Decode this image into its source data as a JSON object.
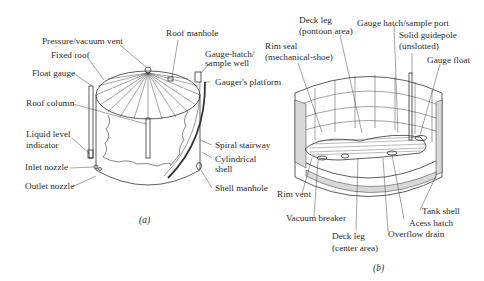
{
  "figure_a": {
    "caption": "(a)",
    "labels": {
      "pressure_vacuum_vent": "Pressure/vacuum vent",
      "roof_manhole": "Roof manhole",
      "fixed_roof": "Fixed roof",
      "gauge_hatch_1": "Gauge-hatch/",
      "gauge_hatch_2": "sample well",
      "float_gauge": "Float gauge",
      "gaugers_platform": "Gauger's platform",
      "roof_column": "Roof column",
      "liquid_level_1": "Liquid level",
      "liquid_level_2": "indicator",
      "spiral_stairway": "Spiral stairway",
      "inlet_nozzle": "Inlet nozzle",
      "cylindrical_shell_1": "Cylindrical",
      "cylindrical_shell_2": "shell",
      "outlet_nozzle": "Outlet nozzle",
      "shell_manhole": "Shell manhole"
    }
  },
  "figure_b": {
    "caption": "(b)",
    "labels": {
      "deck_leg_pontoon_1": "Deck leg",
      "deck_leg_pontoon_2": "(pontoon area)",
      "gauge_hatch_sample_port": "Gauge hatch/sample port",
      "rim_seal_1": "Rim seal",
      "rim_seal_2": "(mechanical-shoe)",
      "solid_guidepole_1": "Solid guidepole",
      "solid_guidepole_2": "(unslotted)",
      "gauge_float": "Gauge float",
      "rim_vent": "Rim vent",
      "tank_shell": "Tank shell",
      "vacuum_breaker": "Vacuum breaker",
      "acess_hatch": "Acess hatch",
      "deck_leg_center_1": "Deck leg",
      "deck_leg_center_2": "(center area)",
      "overflow_drain": "Overflow drain"
    }
  }
}
